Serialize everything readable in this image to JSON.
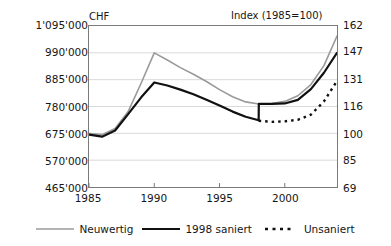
{
  "chart_data": {
    "type": "line",
    "title": "",
    "xlabel": "",
    "ylabel": "CHF",
    "y2label": "Index (1985=100)",
    "grid": true,
    "legend_position": "bottom",
    "x": [
      1985,
      1986,
      1987,
      1988,
      1989,
      1990,
      1991,
      1992,
      1993,
      1994,
      1995,
      1996,
      1997,
      1998,
      1998.01,
      1999,
      2000,
      2001,
      2002,
      2003,
      2004
    ],
    "xlim": [
      1985,
      2004
    ],
    "xticks": [
      1985,
      1990,
      1995,
      2000
    ],
    "xtick_labels": [
      "1985",
      "1990",
      "1995",
      "2000"
    ],
    "ylim": [
      465000,
      1095000
    ],
    "yticks": [
      465000,
      570000,
      675000,
      780000,
      885000,
      990000,
      1095000
    ],
    "ytick_labels": [
      "465'000",
      "570'000",
      "675'000",
      "780'000",
      "885'000",
      "990'000",
      "1'095'000"
    ],
    "y2lim": [
      69,
      162
    ],
    "y2ticks": [
      69,
      85,
      100,
      116,
      131,
      147,
      162
    ],
    "y2tick_labels": [
      "69",
      "85",
      "100",
      "116",
      "131",
      "147",
      "162"
    ],
    "series": [
      {
        "name": "Neuwertig",
        "color": "#9a9a9a",
        "style": "solid",
        "width": 1.6,
        "x": [
          1985,
          1986,
          1987,
          1988,
          1989,
          1990,
          1991,
          1992,
          1993,
          1994,
          1995,
          1996,
          1997,
          1998,
          1999,
          2000,
          2001,
          2002,
          2003,
          2004
        ],
        "values": [
          674000,
          670000,
          694000,
          760000,
          872000,
          990000,
          962000,
          932000,
          906000,
          878000,
          846000,
          818000,
          798000,
          790000,
          792000,
          800000,
          822000,
          866000,
          940000,
          1056000
        ]
      },
      {
        "name": "1998 saniert",
        "color": "#111111",
        "style": "solid",
        "width": 2.2,
        "x": [
          1985,
          1986,
          1987,
          1988,
          1989,
          1990,
          1991,
          1992,
          1993,
          1994,
          1995,
          1996,
          1997,
          1998,
          1998.01,
          1999,
          2000,
          2001,
          2002,
          2003,
          2004
        ],
        "values": [
          670000,
          662000,
          686000,
          750000,
          816000,
          874000,
          862000,
          846000,
          828000,
          806000,
          784000,
          760000,
          740000,
          726000,
          790000,
          790000,
          792000,
          806000,
          848000,
          912000,
          990000
        ]
      },
      {
        "name": "Unsaniert",
        "color": "#111111",
        "style": "dashed",
        "width": 2.4,
        "x": [
          1998,
          1999,
          2000,
          2001,
          2002,
          2003,
          2004
        ],
        "values": [
          724000,
          720000,
          722000,
          728000,
          748000,
          800000,
          880000
        ]
      }
    ]
  },
  "legend": {
    "items": [
      {
        "label": "Neuwertig",
        "icon": "line-solid-gray-swatch"
      },
      {
        "label": "1998 saniert",
        "icon": "line-solid-black-swatch"
      },
      {
        "label": "Unsaniert",
        "icon": "line-dashed-black-swatch"
      }
    ]
  }
}
